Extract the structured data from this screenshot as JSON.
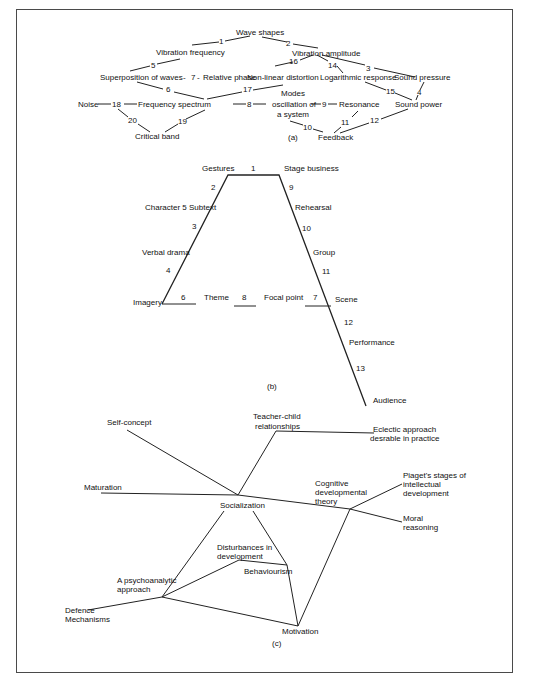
{
  "diagram_a": {
    "caption": "(a)",
    "nodes": {
      "wave_shapes": "Wave shapes",
      "vibration_frequency": "Vibration frequency",
      "vibration_amplitude": "Vibration amplitude",
      "superposition": "Superposition of waves",
      "relative_phase": "Relative phase",
      "nonlinear": "Non-linear distortion",
      "logarithmic": "Logarithmic response",
      "sound_pressure": "Sound pressure",
      "noise": "Noise",
      "frequency_spectrum": "Frequency spectrum",
      "modes_1": "Modes",
      "modes_2": "oscillation of",
      "modes_3": "a system",
      "resonance": "Resonance",
      "sound_power": "Sound power",
      "critical_band": "Critical band",
      "feedback": "Feedback"
    },
    "edges": {
      "e1": "1",
      "e2": "2",
      "e3": "3",
      "e4": "4",
      "e5": "5",
      "e6": "6",
      "e7": "7",
      "e8": "8",
      "e9": "9",
      "e10": "10",
      "e11": "11",
      "e12": "12",
      "e14": "14",
      "e15": "15",
      "e16": "16",
      "e17": "17",
      "e18": "18",
      "e19": "19",
      "e20": "20"
    }
  },
  "diagram_b": {
    "caption": "(b)",
    "nodes": {
      "gestures": "Gestures",
      "stage_business": "Stage business",
      "character_subtext": "Character 5 Subtext",
      "rehearsal": "Rehearsal",
      "verbal_drama": "Verbal drama",
      "group": "Group",
      "imagery": "Imagery",
      "theme": "Theme",
      "focal_point": "Focal point",
      "scene": "Scene",
      "performance": "Performance",
      "audience": "Audience"
    },
    "edges": {
      "e1": "1",
      "e2": "2",
      "e3": "3",
      "e4": "4",
      "e6": "6",
      "e7": "7",
      "e8": "8",
      "e9": "9",
      "e10": "10",
      "e11": "11",
      "e12": "12",
      "e13": "13"
    }
  },
  "diagram_c": {
    "caption": "(c)",
    "nodes": {
      "self_concept": "Self-concept",
      "teacher_child_1": "Teacher-child",
      "teacher_child_2": "relationships",
      "eclectic_1": "Eclectic approach",
      "eclectic_2": "desrable in practice",
      "maturation": "Maturation",
      "socialization": "Socialization",
      "cognitive_1": "Cognitive",
      "cognitive_2": "developmental",
      "cognitive_3": "theory",
      "piaget_1": "Piaget's stages of",
      "piaget_2": "intellectual",
      "piaget_3": "development",
      "moral_1": "Moral",
      "moral_2": "reasoning",
      "disturbances_1": "Disturbances in",
      "disturbances_2": "development",
      "behaviourism": "Behaviourism",
      "psychoanalytic_1": "A psychoanalytic",
      "psychoanalytic_2": "approach",
      "defence_1": "Defence",
      "defence_2": "Mechanisms",
      "motivation": "Motivation"
    }
  },
  "colors": {
    "ink": "#111111",
    "line": "#222222",
    "frame": "#4a4a4a",
    "background": "#ffffff"
  }
}
